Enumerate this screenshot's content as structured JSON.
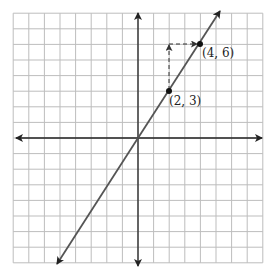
{
  "chart_data": {
    "type": "line",
    "title": "",
    "xlabel": "",
    "ylabel": "",
    "xlim": [
      -8,
      8
    ],
    "ylim": [
      -8,
      8
    ],
    "grid": true,
    "series": [
      {
        "name": "y = 1.5x",
        "slope": 1.5,
        "intercept": 0,
        "x": [
          -5.2,
          0,
          2,
          4,
          5.3
        ],
        "y": [
          -7.8,
          0,
          3,
          6,
          7.95
        ]
      }
    ],
    "points": [
      {
        "x": 2,
        "y": 3,
        "label": "(2, 3)"
      },
      {
        "x": 4,
        "y": 6,
        "label": "(4, 6)"
      }
    ],
    "annotations": [
      {
        "type": "dashed-arrow",
        "description": "vertical rise from (2,3) up to y=6",
        "from": [
          2,
          3
        ],
        "to": [
          2,
          6
        ]
      },
      {
        "type": "dashed-arrow",
        "description": "horizontal run from x=2 to (4,6)",
        "from": [
          2,
          6
        ],
        "to": [
          4,
          6
        ]
      }
    ]
  },
  "labels": {
    "p1": "(2, 3)",
    "p2": "(4, 6)"
  },
  "colors": {
    "grid": "#bdbdbd",
    "axis": "#222222",
    "line": "#555555",
    "point": "#111111"
  }
}
